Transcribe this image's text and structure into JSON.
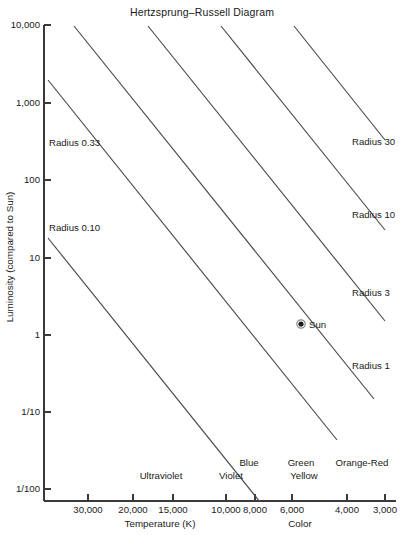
{
  "chart_data": {
    "type": "line",
    "title": "Hertzsprung–Russell Diagram",
    "xlabel": "Temperature (K)",
    "xlabel_secondary": "Color",
    "ylabel": "Luminosity (compared to Sun)",
    "x_axis": {
      "scale": "log-reversed",
      "unit": "K",
      "tick_labels": [
        "30,000",
        "20,000",
        "15,000",
        "10,000",
        "8,000",
        "6,000",
        "4,000",
        "3,000"
      ],
      "tick_values": [
        30000,
        20000,
        15000,
        10000,
        8000,
        6000,
        4000,
        3000
      ],
      "tick_positions_px": [
        88,
        133,
        173,
        226,
        255,
        292,
        347,
        385
      ],
      "range_px": [
        44,
        395
      ]
    },
    "y_axis": {
      "scale": "log",
      "tick_labels": [
        "10,000",
        "1,000",
        "100",
        "10",
        "1",
        "1/10",
        "1/100"
      ],
      "tick_values": [
        10000,
        1000,
        100,
        10,
        1,
        0.1,
        0.01
      ],
      "tick_positions_px": [
        25,
        103,
        180,
        258,
        335,
        412,
        489
      ],
      "range_px": [
        25,
        489
      ]
    },
    "grid": false,
    "legend": "none",
    "series": [
      {
        "name": "Radius 0.10",
        "label_side": "left",
        "label_x": 49,
        "label_y": 231,
        "x1": 48,
        "y1": 238,
        "x2": 260,
        "y2": 502
      },
      {
        "name": "Radius 0.33",
        "label_side": "left",
        "label_x": 49,
        "label_y": 146,
        "x1": 48,
        "y1": 80,
        "x2": 337,
        "y2": 440
      },
      {
        "name": "Radius 1",
        "label_side": "right",
        "label_x": 352,
        "label_y": 369,
        "x1": 74,
        "y1": 26,
        "x2": 374,
        "y2": 399
      },
      {
        "name": "Radius 3",
        "label_side": "right",
        "label_x": 352,
        "label_y": 296,
        "x1": 148,
        "y1": 26,
        "x2": 385,
        "y2": 321
      },
      {
        "name": "Radius 10",
        "label_side": "right",
        "label_x": 352,
        "label_y": 218,
        "x1": 221,
        "y1": 26,
        "x2": 385,
        "y2": 230
      },
      {
        "name": "Radius 30",
        "label_side": "right",
        "label_x": 352,
        "label_y": 145,
        "x1": 294,
        "y1": 26,
        "x2": 385,
        "y2": 140
      }
    ],
    "color_bands": [
      {
        "label": "Ultraviolet",
        "x": 161,
        "y": 479
      },
      {
        "label": "Violet",
        "x": 231,
        "y": 479
      },
      {
        "label": "Blue",
        "x": 249,
        "y": 466
      },
      {
        "label": "Green",
        "x": 301,
        "y": 466
      },
      {
        "label": "Yellow",
        "x": 304,
        "y": 479
      },
      {
        "label": "Orange-Red",
        "x": 362,
        "y": 466
      }
    ],
    "annotations": [
      {
        "name": "Sun",
        "label": "Sun",
        "x_value": 5800,
        "y_value": 1,
        "marker_x": 301,
        "marker_y": 324,
        "label_x": 309,
        "label_y": 328
      }
    ],
    "colors": {
      "line": "#4a4a4a",
      "axis": "#3a3a3a",
      "text": "#1a1a1a",
      "background": "#ffffff",
      "marker": "#1a1a1a"
    }
  },
  "figure": {
    "title": "Hertzsprung–Russell Diagram",
    "title_x": 202,
    "title_y": 16,
    "xlabel_x": 160,
    "xlabel_y": 527,
    "xlabel_secondary_x": 300,
    "xlabel_secondary_y": 527,
    "ylabel_x": 13,
    "ylabel_y": 257
  }
}
